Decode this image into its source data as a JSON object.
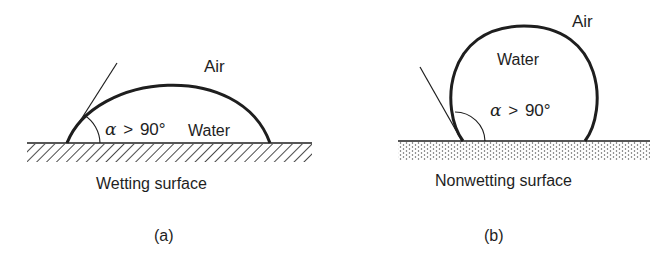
{
  "figure": {
    "panels": [
      {
        "id": "a",
        "caption": "(a)",
        "surface_label": "Wetting surface",
        "surface_pattern": "hatched",
        "air_label": "Air",
        "liquid_label": "Water",
        "angle_symbol": "α",
        "angle_relation": ">",
        "angle_value": "90°"
      },
      {
        "id": "b",
        "caption": "(b)",
        "surface_label": "Nonwetting surface",
        "surface_pattern": "dotted",
        "air_label": "Air",
        "liquid_label": "Water",
        "angle_symbol": "α",
        "angle_relation": ">",
        "angle_value": "90°"
      }
    ],
    "colors": {
      "ink": "#1e1e1e",
      "background": "#ffffff"
    }
  }
}
